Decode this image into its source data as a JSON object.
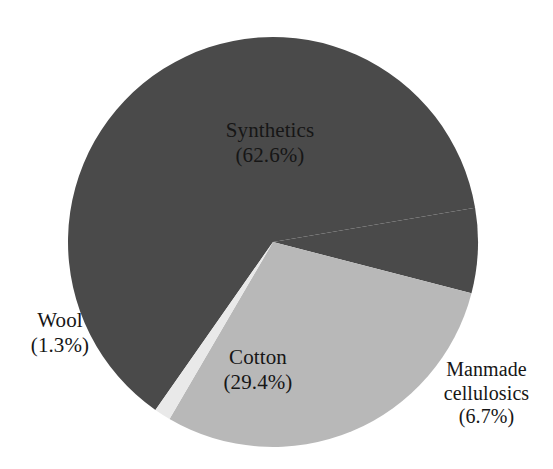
{
  "chart_data": {
    "type": "pie",
    "title": "",
    "subtitle": "",
    "xlabel": "",
    "ylabel": "",
    "legend_position": "none",
    "grid": false,
    "labels_position": "inside-and-outside",
    "units": "percent",
    "total": 100.0,
    "categories": [
      "Synthetics",
      "Cotton",
      "Manmade cellulosics",
      "Wool"
    ],
    "values": [
      62.6,
      29.4,
      6.7,
      1.3
    ],
    "colors": [
      "#4a4a4a",
      "#b8b8b8",
      "#4a4a4a",
      "#e9e9e9"
    ],
    "slices": [
      {
        "name": "Synthetics",
        "value": 62.6,
        "value_text": "(62.6%)",
        "color": "#4a4a4a",
        "label_placement": "inside"
      },
      {
        "name": "Cotton",
        "value": 29.4,
        "value_text": "(29.4%)",
        "color": "#b8b8b8",
        "label_placement": "inside"
      },
      {
        "name": "Manmade cellulosics",
        "value": 6.7,
        "value_text": "(6.7%)",
        "color": "#4a4a4a",
        "label_placement": "outside"
      },
      {
        "name": "Wool",
        "value": 1.3,
        "value_text": "(1.3%)",
        "color": "#e9e9e9",
        "label_placement": "outside"
      }
    ]
  },
  "labels": {
    "synthetics": {
      "name": "Synthetics",
      "value": "(62.6%)"
    },
    "cotton": {
      "name": "Cotton",
      "value": "(29.4%)"
    },
    "wool": {
      "name": "Wool",
      "value": "(1.3%)"
    },
    "manmade": {
      "name_line1": "Manmade",
      "name_line2": "cellulosics",
      "value": "(6.7%)"
    }
  },
  "figure": {
    "background": "#ffffff",
    "center_x": 273,
    "center_y": 242,
    "radius": 205
  }
}
